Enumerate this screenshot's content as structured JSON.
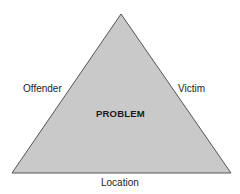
{
  "diagram": {
    "type": "problem-analysis-triangle",
    "center_label": "PROBLEM",
    "sides": {
      "left": "Offender",
      "right": "Victim",
      "bottom": "Location"
    },
    "colors": {
      "fill": "#c9c9c9",
      "stroke": "#555555",
      "text": "#222222"
    }
  }
}
